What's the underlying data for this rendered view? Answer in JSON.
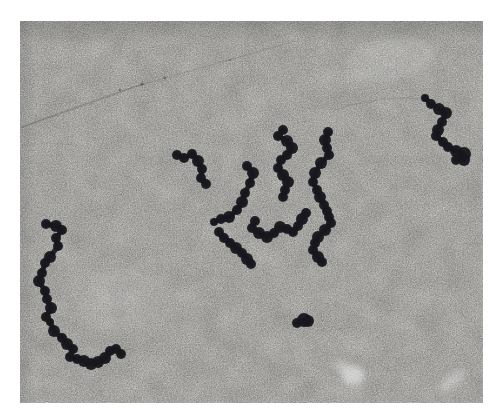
{
  "image": {
    "kind": "electron-micrograph",
    "subject": "beads-on-a-string chains of dark globular particles (nucleosome-like bead chains) scattered on a grainy photographic emulsion background",
    "page_background": "#ffffff",
    "film": {
      "x": 20,
      "y": 21,
      "width": 463,
      "height": 382,
      "base_color": "#c8c7c3"
    },
    "bead_color": "#18181b",
    "scratch_color": "#3a3a3a",
    "smudge_color": "#ffffff",
    "chains": [
      {
        "name": "bottom-left-chain",
        "points": [
          [
            46,
            224,
            5
          ],
          [
            56,
            226,
            6
          ],
          [
            62,
            230,
            5
          ],
          [
            56,
            238,
            5
          ],
          [
            58,
            246,
            5
          ],
          [
            50,
            257,
            6
          ],
          [
            45,
            263,
            5
          ],
          [
            42,
            273,
            5
          ],
          [
            39,
            281,
            6
          ],
          [
            45,
            291,
            5
          ],
          [
            47,
            299,
            5
          ],
          [
            51,
            308,
            6
          ],
          [
            46,
            317,
            5
          ],
          [
            50,
            322,
            4
          ],
          [
            54,
            331,
            6
          ],
          [
            62,
            338,
            5
          ],
          [
            67,
            344,
            6
          ],
          [
            73,
            349,
            5
          ],
          [
            70,
            357,
            5
          ],
          [
            77,
            359,
            5
          ],
          [
            84,
            361,
            6
          ],
          [
            91,
            364,
            6
          ],
          [
            98,
            362,
            6
          ],
          [
            105,
            358,
            6
          ],
          [
            110,
            351,
            5
          ],
          [
            116,
            349,
            5
          ],
          [
            121,
            354,
            5
          ]
        ]
      },
      {
        "name": "left-small-chain",
        "points": [
          [
            177,
            155,
            5
          ],
          [
            184,
            158,
            5
          ],
          [
            192,
            154,
            5
          ],
          [
            198,
            161,
            6
          ],
          [
            202,
            169,
            5
          ],
          [
            201,
            178,
            5
          ],
          [
            206,
            184,
            5
          ]
        ]
      },
      {
        "name": "center-hook-chain",
        "points": [
          [
            247,
            166,
            5
          ],
          [
            253,
            173,
            6
          ],
          [
            250,
            183,
            5
          ],
          [
            245,
            193,
            5
          ],
          [
            242,
            202,
            6
          ],
          [
            237,
            210,
            5
          ],
          [
            229,
            217,
            6
          ],
          [
            221,
            219,
            5
          ],
          [
            214,
            222,
            4
          ]
        ]
      },
      {
        "name": "center-tail-chain",
        "points": [
          [
            219,
            232,
            5
          ],
          [
            224,
            238,
            5
          ],
          [
            230,
            243,
            5
          ],
          [
            236,
            248,
            6
          ],
          [
            242,
            253,
            5
          ],
          [
            247,
            259,
            6
          ],
          [
            251,
            264,
            5
          ]
        ]
      },
      {
        "name": "center-squiggle-chain",
        "points": [
          [
            255,
            221,
            5
          ],
          [
            252,
            228,
            5
          ],
          [
            259,
            233,
            6
          ],
          [
            267,
            237,
            6
          ],
          [
            274,
            233,
            5
          ],
          [
            280,
            227,
            6
          ],
          [
            287,
            229,
            5
          ],
          [
            293,
            232,
            5
          ],
          [
            298,
            226,
            5
          ],
          [
            302,
            219,
            6
          ],
          [
            306,
            213,
            5
          ]
        ]
      },
      {
        "name": "center-s-chain",
        "points": [
          [
            283,
            130,
            5
          ],
          [
            278,
            136,
            5
          ],
          [
            287,
            141,
            6
          ],
          [
            292,
            148,
            6
          ],
          [
            287,
            155,
            5
          ],
          [
            281,
            160,
            5
          ],
          [
            278,
            168,
            5
          ],
          [
            283,
            175,
            6
          ],
          [
            288,
            182,
            6
          ],
          [
            285,
            190,
            5
          ],
          [
            283,
            197,
            5
          ]
        ]
      },
      {
        "name": "right-s-chain",
        "points": [
          [
            328,
            132,
            5
          ],
          [
            325,
            140,
            6
          ],
          [
            327,
            148,
            5
          ],
          [
            329,
            155,
            5
          ],
          [
            321,
            163,
            6
          ],
          [
            315,
            173,
            6
          ],
          [
            313,
            182,
            5
          ],
          [
            317,
            190,
            5
          ],
          [
            320,
            197,
            6
          ],
          [
            324,
            205,
            5
          ],
          [
            327,
            211,
            5
          ],
          [
            329,
            217,
            5
          ],
          [
            331,
            223,
            5
          ],
          [
            325,
            230,
            6
          ],
          [
            318,
            237,
            6
          ],
          [
            315,
            243,
            5
          ],
          [
            313,
            250,
            5
          ],
          [
            318,
            257,
            6
          ],
          [
            322,
            262,
            5
          ]
        ]
      },
      {
        "name": "top-right-chain",
        "points": [
          [
            425,
            98,
            4
          ],
          [
            431,
            104,
            5
          ],
          [
            439,
            109,
            6
          ],
          [
            446,
            113,
            6
          ],
          [
            442,
            122,
            5
          ],
          [
            438,
            130,
            6
          ],
          [
            436,
            136,
            5
          ],
          [
            443,
            142,
            5
          ],
          [
            448,
            147,
            5
          ],
          [
            456,
            151,
            6
          ],
          [
            464,
            154,
            7
          ],
          [
            464,
            160,
            6
          ],
          [
            456,
            160,
            5
          ]
        ]
      },
      {
        "name": "isolated-blob",
        "points": [
          [
            297,
            323,
            5
          ],
          [
            304,
            320,
            7
          ],
          [
            308,
            321,
            6
          ]
        ]
      }
    ],
    "scratches": [
      {
        "d": "M298,40 Q 210,66 143,84 Q 80,104 21,128",
        "opacity": 0.14,
        "width": 1.3
      },
      {
        "d": "M143,84 Q 88,104 22,127",
        "opacity": 0.2,
        "width": 1.4
      },
      {
        "d": "M252,46 L 318,24",
        "opacity": 0.09,
        "width": 1
      },
      {
        "d": "M335,110 Q 375,95 424,99",
        "opacity": 0.13,
        "width": 1.2
      },
      {
        "d": "M22,146 Q 60,139 98,150",
        "opacity": 0.09,
        "width": 1
      }
    ],
    "scratch_dots": [
      [
        142,
        84,
        1.6
      ],
      [
        120,
        90,
        1.2
      ],
      [
        165,
        78,
        1.2
      ],
      [
        230,
        60,
        1.1
      ]
    ],
    "smudges": [
      {
        "cx": 353,
        "cy": 375,
        "rx": 12,
        "ry": 10,
        "rot": 0,
        "opacity": 0.5
      },
      {
        "cx": 341,
        "cy": 366,
        "rx": 7,
        "ry": 6,
        "rot": 0,
        "opacity": 0.35
      },
      {
        "cx": 452,
        "cy": 381,
        "rx": 16,
        "ry": 6,
        "rot": -40,
        "opacity": 0.3
      },
      {
        "cx": 390,
        "cy": 60,
        "rx": 45,
        "ry": 22,
        "rot": -10,
        "opacity": 0.12
      },
      {
        "cx": 120,
        "cy": 300,
        "rx": 40,
        "ry": 30,
        "rot": 0,
        "opacity": 0.08
      }
    ]
  }
}
